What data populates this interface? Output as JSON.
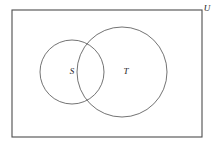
{
  "figure": {
    "type": "venn-diagram",
    "width": 220,
    "height": 145,
    "background_color": "#ffffff"
  },
  "universe": {
    "label": "U",
    "label_x": 207,
    "label_y": 9,
    "rect": {
      "x": 12,
      "y": 10,
      "width": 190,
      "height": 127
    },
    "stroke_color": "#4d4d4d",
    "stroke_width": 1.1
  },
  "sets": [
    {
      "id": "s",
      "label": "S",
      "cx": 72,
      "cy": 72,
      "r": 32,
      "label_x": 72,
      "label_y": 72,
      "stroke_color": "#5a5a5a",
      "stroke_width": 0.85
    },
    {
      "id": "t",
      "label": "T",
      "cx": 122,
      "cy": 72,
      "r": 45,
      "label_x": 126,
      "label_y": 72,
      "stroke_color": "#5a5a5a",
      "stroke_width": 0.85
    }
  ]
}
